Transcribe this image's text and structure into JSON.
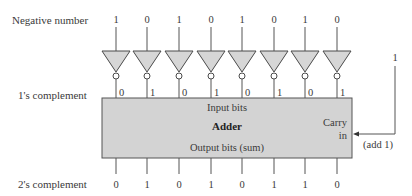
{
  "diagram": {
    "rows": {
      "negative": {
        "label": "Negative number",
        "bits": [
          "1",
          "0",
          "1",
          "0",
          "1",
          "0",
          "1",
          "0"
        ]
      },
      "ones_complement": {
        "label": "1's complement",
        "bits": [
          "0",
          "1",
          "0",
          "1",
          "0",
          "1",
          "0",
          "1"
        ]
      },
      "twos_complement": {
        "label": "2's complement",
        "bits": [
          "0",
          "1",
          "0",
          "1",
          "0",
          "1",
          "1",
          "0"
        ]
      }
    },
    "gates": {
      "count": 8,
      "type": "inverter",
      "fill": "#d6d6d6",
      "stroke": "#4a4a4a"
    },
    "adder": {
      "title": "Adder",
      "input_label": "Input bits",
      "output_label": "Output bits (sum)",
      "carry_label_line1": "Carry",
      "carry_label_line2": "in",
      "fill": "#d3d3d3"
    },
    "carry_input": {
      "value": "1",
      "note": "(add 1)"
    }
  }
}
